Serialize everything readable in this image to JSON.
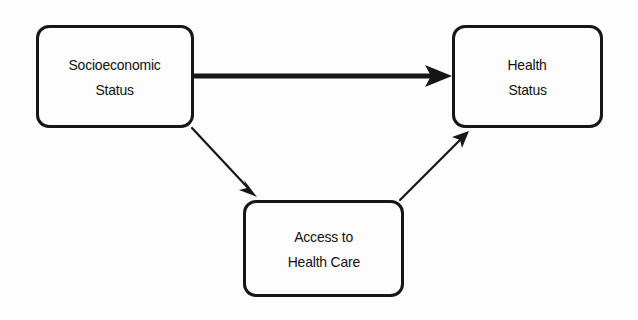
{
  "diagram": {
    "type": "path-diagram",
    "background_color": "#fdfdfd",
    "stroke_color": "#161616",
    "text_color": "#111111",
    "nodes": [
      {
        "id": "socioeconomic-status",
        "lines": [
          "Socioeconomic",
          "Status"
        ],
        "shape": "rounded-rectangle",
        "x": 36,
        "y": 25,
        "width": 158,
        "height": 103
      },
      {
        "id": "access-to-health-care",
        "lines": [
          "Access to",
          "Health Care"
        ],
        "shape": "rounded-rectangle",
        "x": 243,
        "y": 200,
        "width": 161,
        "height": 97
      },
      {
        "id": "health-status",
        "lines": [
          "Health",
          "Status"
        ],
        "shape": "rounded-rectangle",
        "x": 452,
        "y": 25,
        "width": 151,
        "height": 103
      }
    ],
    "edges": [
      {
        "id": "ses-to-health-status",
        "from": "socioeconomic-status",
        "to": "health-status",
        "weight": "thick",
        "stroke_width": 5,
        "label": "",
        "arrowhead": "solid-triangle"
      },
      {
        "id": "ses-to-access",
        "from": "socioeconomic-status",
        "to": "access-to-health-care",
        "weight": "thin",
        "stroke_width": 2,
        "label": "",
        "arrowhead": "solid-triangle"
      },
      {
        "id": "access-to-health-status",
        "from": "access-to-health-care",
        "to": "health-status",
        "weight": "thin",
        "stroke_width": 2,
        "label": "",
        "arrowhead": "solid-triangle"
      }
    ]
  }
}
